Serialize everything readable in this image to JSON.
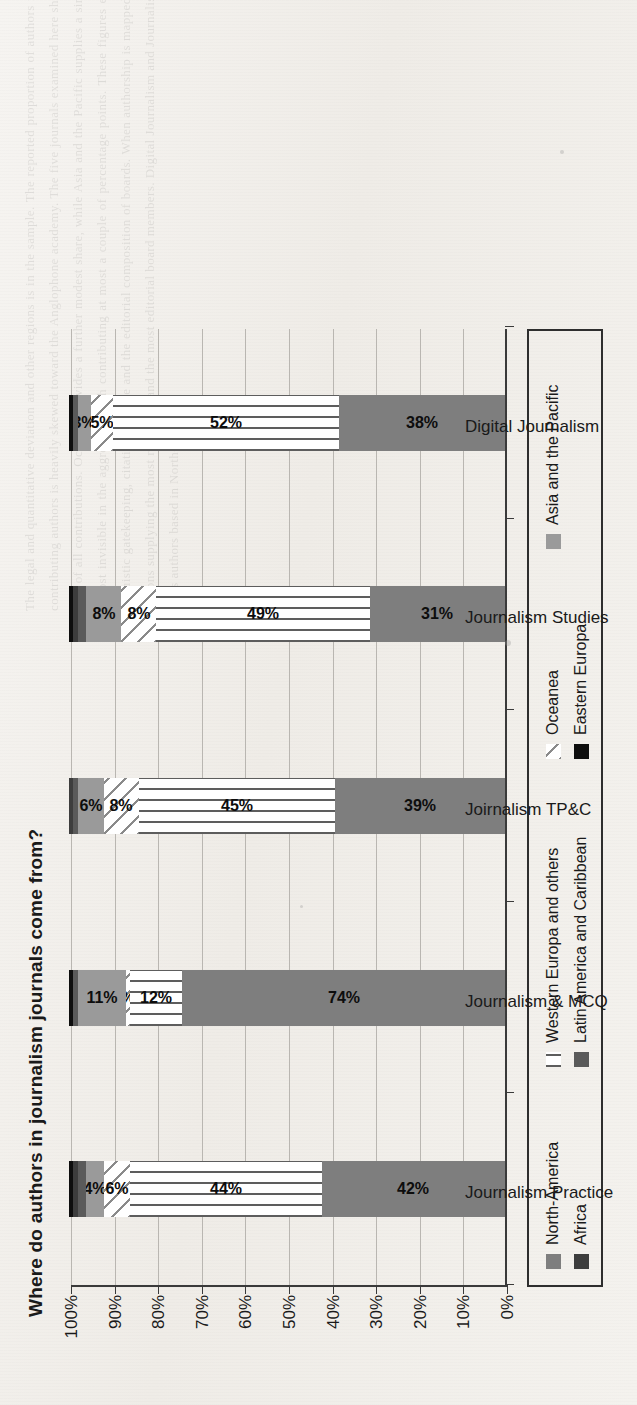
{
  "chart_data": {
    "type": "bar",
    "subtype": "stacked-bar-100-percent",
    "title": "Where do authors in journalism journals come from?",
    "xlabel": "",
    "ylabel": "",
    "ylim": [
      0,
      100
    ],
    "ytick_labels": [
      "0%",
      "10%",
      "20%",
      "30%",
      "40%",
      "50%",
      "60%",
      "70%",
      "80%",
      "90%",
      "100%"
    ],
    "ytick_values": [
      0,
      10,
      20,
      30,
      40,
      50,
      60,
      70,
      80,
      90,
      100
    ],
    "grid": true,
    "legend_position": "bottom",
    "orientation": "rotated-90-ccw",
    "categories": [
      "Journalism Practice",
      "Journalism & MCQ",
      "Joirnalism TP&C",
      "Journalism Studies",
      "Digital Journalism"
    ],
    "series": [
      {
        "name": "North-America",
        "values": [
          42,
          74,
          39,
          31,
          38
        ],
        "labels": [
          "42%",
          "74%",
          "39%",
          "31%",
          "38%"
        ],
        "color": "#7e7e7e",
        "pattern": "solid"
      },
      {
        "name": "Western Europa and others",
        "values": [
          44,
          12,
          45,
          49,
          52
        ],
        "labels": [
          "44%",
          "12%",
          "45%",
          "49%",
          "52%"
        ],
        "color": "#5d5d5d",
        "pattern": "vertical-lines"
      },
      {
        "name": "Oceanea",
        "values": [
          6,
          1,
          8,
          8,
          5
        ],
        "labels": [
          "6%",
          "1%",
          "8%",
          "8%",
          "5%"
        ],
        "color": "#8a8a8a",
        "pattern": "diagonal-hatch"
      },
      {
        "name": "Asia and the Pacific",
        "values": [
          4,
          11,
          6,
          8,
          3
        ],
        "labels": [
          "4%",
          "11%",
          "6%",
          "8%",
          "3%"
        ],
        "color": "#9a9a9a",
        "pattern": "solid"
      },
      {
        "name": "Latin America and Caribbean",
        "values": [
          2,
          1,
          1,
          2,
          1
        ],
        "labels": [
          "",
          "",
          "",
          "",
          ""
        ],
        "color": "#5a5a5a",
        "pattern": "solid"
      },
      {
        "name": "Africa",
        "values": [
          1,
          0,
          1,
          1,
          0
        ],
        "labels": [
          "",
          "",
          "",
          "",
          ""
        ],
        "color": "#3d3d3d",
        "pattern": "solid"
      },
      {
        "name": "Eastern Europa",
        "values": [
          1,
          1,
          0,
          1,
          1
        ],
        "labels": [
          "",
          "",
          "",
          "",
          ""
        ],
        "color": "#0e0e0e",
        "pattern": "solid"
      }
    ]
  },
  "legend": {
    "row1": [
      {
        "label": "North-America",
        "swatch": "solid-gray"
      },
      {
        "label": "Western Europa and others",
        "swatch": "vertical-lines"
      },
      {
        "label": "Oceanea",
        "swatch": "diagonal-hatch"
      },
      {
        "label": "Asia and the Pacific",
        "swatch": "solid-mid-gray"
      }
    ],
    "row2": [
      {
        "label": "Africa",
        "swatch": "solid-dark-gray"
      },
      {
        "label": "Latin America and Caribbean",
        "swatch": "solid-darker-gray"
      },
      {
        "label": "Eastern Europa",
        "swatch": "solid-black"
      }
    ]
  },
  "page": {
    "ghost_text": "The legal and quantitative deviation and other regions is in the sample. The reported proportion of authors from the specific region in the overall author population remains limited. Within the field of journalism studies, the distribution of contributing authors is heavily skewed toward the Anglophone academy. The five journals examined here show remarkably similar profiles, with North-America and Western Europa together accounting for between eighty and eighty-six per cent of all contributions. Oceanea provides a further modest share, while Asia and the Pacific supplies a single-digit to low double-digit proportion depending on the outlet. Latin America and Caribbean, Africa and Eastern Europa remain almost invisible in the aggregate, each contributing at most a couple of percentage points. These figures echo earlier findings about the geography of knowledge production in communication research and raise familiar questions about linguistic gatekeeping, citation practice and the editorial composition of boards. When authorship is mapped onto the editorial structures of the same journals, the correspondence is close: the regions producing the most articles are also the regions supplying the most reviewers and the most editorial board members. Digital Journalism and Journalism Studies display the broadest distributions, whereas Journalism & MCQ remains the most concentrated, with nearly three quarters of its authors based in North-America."
  }
}
